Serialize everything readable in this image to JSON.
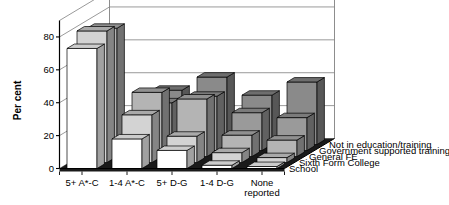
{
  "chart_data": {
    "type": "bar",
    "render": "3d-grouped-bar",
    "title": "",
    "xlabel": "",
    "ylabel": "Per cent",
    "ylim": [
      0,
      90
    ],
    "yticks": [
      0,
      20,
      40,
      60,
      80
    ],
    "ytick_labels": [
      "0",
      "20",
      "40",
      "60",
      "80"
    ],
    "grid": true,
    "legend_position": "depth-axis-right",
    "categories": [
      "5+ A*-C",
      "1-4 A*-C",
      "5+ D-G",
      "1-4 D-G",
      "None reported"
    ],
    "category_label_lines": [
      [
        "5+ A*-C"
      ],
      [
        "1-4 A*-C"
      ],
      [
        "5+ D-G"
      ],
      [
        "1-4 D-G"
      ],
      [
        "None",
        "reported"
      ]
    ],
    "series": [
      {
        "name": "School",
        "values": [
          73,
          18,
          11,
          2,
          1
        ]
      },
      {
        "name": "Sixth Form College",
        "values": [
          80,
          29,
          16,
          6,
          3
        ]
      },
      {
        "name": "General FE",
        "values": [
          78,
          39,
          35,
          13,
          10
        ]
      },
      {
        "name": "Government supported training",
        "values": [
          6,
          29,
          33,
          23,
          20
        ]
      },
      {
        "name": "Not in education/training",
        "values": [
          4,
          33,
          41,
          30,
          38
        ]
      }
    ],
    "series_colors": [
      "#ffffff",
      "#d3d3d3",
      "#b4b4b4",
      "#9a9a9a",
      "#8a8a8a"
    ],
    "floor_color": "#1a1a1a",
    "wall_color": "#ffffff",
    "grid_color": "#808080",
    "axis_color": "#000000"
  },
  "axis": {
    "y_title": "Per cent"
  }
}
